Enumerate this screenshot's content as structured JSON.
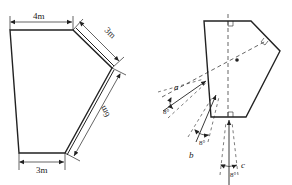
{
  "left_figure": {
    "dimensions": {
      "top": "4m",
      "upper_right": "3m",
      "lower_right": "6m",
      "bottom": "3m"
    }
  },
  "right_figure": {
    "ray_labels": {
      "a": "a",
      "b": "b",
      "c": "c"
    },
    "angles": {
      "a": "8°",
      "b": "8°",
      "c": "8°"
    }
  },
  "colors": {
    "stroke": "#222222",
    "background": "#ffffff"
  }
}
